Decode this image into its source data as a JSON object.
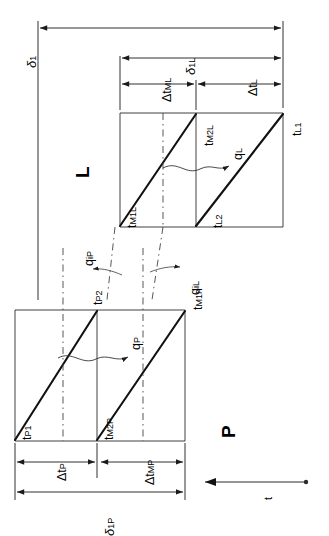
{
  "figure": {
    "orientation": "rotated-90-ccw",
    "axis": {
      "label": "t",
      "direction": "leftward-arrow"
    },
    "regions": [
      {
        "key": "P",
        "label": "P"
      },
      {
        "key": "L",
        "label": "L"
      }
    ]
  },
  "labels": {
    "t_P1": {
      "base": "t",
      "sub": "P1"
    },
    "t_P2": {
      "base": "t",
      "sub": "P2"
    },
    "t_M1P": {
      "base": "t",
      "sub": "M1P"
    },
    "t_M2P": {
      "base": "t",
      "sub": "M2P"
    },
    "t_M1L": {
      "base": "t",
      "sub": "M1L"
    },
    "t_M2L": {
      "base": "t",
      "sub": "M2L"
    },
    "t_L1": {
      "base": "t",
      "sub": "L1"
    },
    "t_L2": {
      "base": "t",
      "sub": "L2"
    },
    "q_P": {
      "base": "q",
      "sub": "P"
    },
    "q_L": {
      "base": "q",
      "sub": "L"
    },
    "q_iP": {
      "base": "q",
      "sub": "iP"
    },
    "q_iL": {
      "base": "q",
      "sub": "iL"
    },
    "region_P": "P",
    "region_L": "L",
    "axis_t": "t"
  },
  "dimensions": [
    {
      "key": "delta_1",
      "base": "δ",
      "sub": "1",
      "section": "overall"
    },
    {
      "key": "delta_1L",
      "base": "δ",
      "sub": "1L",
      "section": "L"
    },
    {
      "key": "delta_1P",
      "base": "δ",
      "sub": "1P",
      "section": "P"
    },
    {
      "key": "dt_ML",
      "base": "Δt",
      "sub": "ML",
      "section": "L"
    },
    {
      "key": "dt_L",
      "base": "Δt",
      "sub": "L",
      "section": "L"
    },
    {
      "key": "dt_P",
      "base": "Δt",
      "sub": "P",
      "section": "P"
    },
    {
      "key": "dt_MP",
      "base": "Δt",
      "sub": "MP",
      "section": "P"
    }
  ],
  "colors": {
    "background": "#ffffff",
    "stroke_thick": "#111111",
    "stroke_thin": "#3a3a3a",
    "stroke_dash": "#444444",
    "text": "#0b0b0b"
  }
}
